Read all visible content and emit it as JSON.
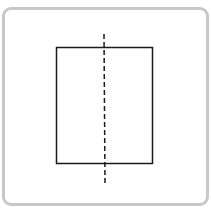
{
  "diagram": {
    "frame": {
      "border_color": "#c8c8c8"
    },
    "rectangle": {
      "x": 56,
      "y": 47,
      "width": 97,
      "height": 117,
      "stroke": "#1a1a1a"
    },
    "symmetry_line": {
      "x": 104,
      "y1": 34,
      "y2": 183,
      "style": "dashed",
      "stroke": "#1a1a1a"
    }
  }
}
